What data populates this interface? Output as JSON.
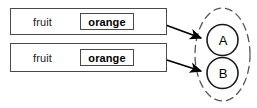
{
  "diagram": {
    "type": "entity-attribute-mapping",
    "attribute_rows": [
      {
        "id": "row-1",
        "label": "fruit",
        "value": "orange",
        "connector": "port-circle",
        "arrow_to": "A"
      },
      {
        "id": "row-2",
        "label": "fruit",
        "value": "orange",
        "connector": "port-circle",
        "arrow_to": "B"
      }
    ],
    "group": {
      "shape": "dashed-ellipse",
      "nodes": [
        {
          "id": "A",
          "label": "A"
        },
        {
          "id": "B",
          "label": "B"
        }
      ]
    },
    "colors": {
      "stroke": "#4a4a4a",
      "node_stroke": "#1a1a1a",
      "arrow": "#000000",
      "background": "#ffffff",
      "text": "#000000"
    }
  }
}
